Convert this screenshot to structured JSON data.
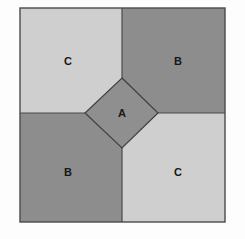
{
  "figure": {
    "title": "",
    "type": "geometric-diagram",
    "background_color": "#fdfdfd",
    "border_color": "#4a4a4a",
    "outer_square": {
      "x": 20,
      "y": 8,
      "width": 205,
      "height": 214
    },
    "divider": {
      "vertical_x": 122,
      "horizontal_y": 113,
      "color": "#4a4a4a"
    },
    "center_shape": {
      "name": "A",
      "shape": "rotated-square",
      "fill": "#8f8f8f",
      "stroke": "#3f3f3f",
      "vertices": [
        [
          122,
          78
        ],
        [
          158,
          113
        ],
        [
          122,
          148
        ],
        [
          85,
          113
        ]
      ],
      "label": "A",
      "label_x": 122,
      "label_y": 117
    },
    "regions": [
      {
        "id": "top-left",
        "label": "C",
        "fill": "#cfcfcf",
        "label_x": 68,
        "label_y": 61
      },
      {
        "id": "top-right",
        "label": "B",
        "fill": "#8d8d8d",
        "label_x": 178,
        "label_y": 61
      },
      {
        "id": "bottom-left",
        "label": "B",
        "fill": "#8d8d8d",
        "label_x": 68,
        "label_y": 172
      },
      {
        "id": "bottom-right",
        "label": "C",
        "fill": "#cfcfcf",
        "label_x": 178,
        "label_y": 172
      }
    ]
  }
}
